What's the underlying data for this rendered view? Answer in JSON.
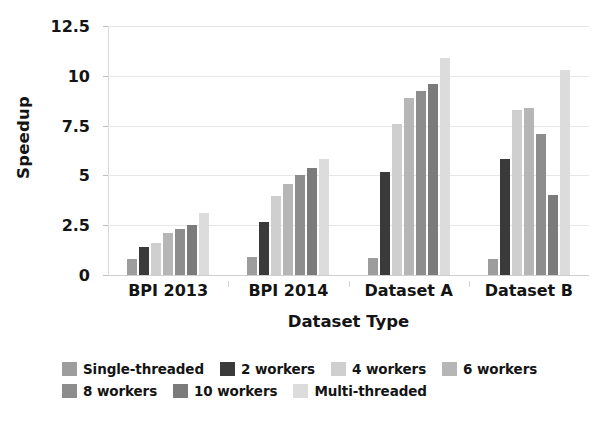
{
  "chart_data": {
    "type": "bar",
    "title": "",
    "xlabel": "Dataset Type",
    "ylabel": "Speedup",
    "categories": [
      "BPI 2013",
      "BPI 2014",
      "Dataset A",
      "Dataset B"
    ],
    "ylim": [
      0,
      12.5
    ],
    "yticks": [
      "0",
      "2.5",
      "5",
      "7.5",
      "10",
      "12.5"
    ],
    "ytick_values": [
      0,
      2.5,
      5,
      7.5,
      10,
      12.5
    ],
    "grid": true,
    "legend_position": "bottom",
    "series": [
      {
        "name": "Single-threaded",
        "color": "#9d9d9d",
        "values": [
          0.8,
          0.9,
          0.85,
          0.8
        ]
      },
      {
        "name": "2 workers",
        "color": "#3a3a3a",
        "values": [
          1.4,
          2.65,
          5.15,
          5.8
        ]
      },
      {
        "name": "4 workers",
        "color": "#cfcfcf",
        "values": [
          1.6,
          3.95,
          7.6,
          8.3
        ]
      },
      {
        "name": "6 workers",
        "color": "#b6b6b6",
        "values": [
          2.1,
          4.55,
          8.9,
          8.4
        ]
      },
      {
        "name": "8 workers",
        "color": "#8d8d8d",
        "values": [
          2.3,
          5.0,
          9.25,
          7.1
        ]
      },
      {
        "name": "10 workers",
        "color": "#7b7b7b",
        "values": [
          2.5,
          5.35,
          9.6,
          4.0
        ]
      },
      {
        "name": "Multi-threaded",
        "color": "#dcdcdc",
        "values": [
          3.1,
          5.8,
          10.9,
          10.3
        ]
      }
    ]
  },
  "axes": {
    "y_title": "Speedup",
    "x_title": "Dataset Type",
    "y_tick_0": "0",
    "y_tick_1": "2.5",
    "y_tick_2": "5",
    "y_tick_3": "7.5",
    "y_tick_4": "10",
    "y_tick_5": "12.5",
    "x_tick_0": "BPI 2013",
    "x_tick_1": "BPI 2014",
    "x_tick_2": "Dataset A",
    "x_tick_3": "Dataset B"
  },
  "legend": {
    "items": [
      {
        "label": "Single-threaded",
        "color": "#9d9d9d"
      },
      {
        "label": "2 workers",
        "color": "#3a3a3a"
      },
      {
        "label": "4 workers",
        "color": "#cfcfcf"
      },
      {
        "label": "6 workers",
        "color": "#b6b6b6"
      },
      {
        "label": "8 workers",
        "color": "#8d8d8d"
      },
      {
        "label": "10 workers",
        "color": "#7b7b7b"
      },
      {
        "label": "Multi-threaded",
        "color": "#dcdcdc"
      }
    ]
  },
  "style": {
    "background": "#ffffff",
    "gridline_color": "#e7e7e7",
    "text_color": "#141414"
  }
}
